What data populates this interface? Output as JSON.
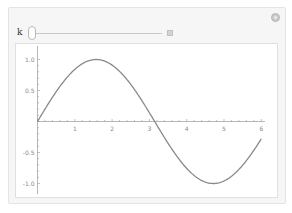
{
  "controls": {
    "parameter_label": "k",
    "slider_value": 0,
    "settings_icon": "gear-icon",
    "expand_icon": "plus-icon"
  },
  "plot": {
    "x_ticks": [
      "1",
      "2",
      "3",
      "4",
      "5",
      "6"
    ],
    "y_ticks": [
      "1.0",
      "0.5",
      "-0.5",
      "-1.0"
    ]
  },
  "chart_data": {
    "type": "line",
    "title": "",
    "xlabel": "",
    "ylabel": "",
    "xlim": [
      0,
      6.28
    ],
    "ylim": [
      -1.1,
      1.1
    ],
    "grid": false,
    "series": [
      {
        "name": "sin(x)",
        "x": [
          0,
          0.5,
          1,
          1.5,
          1.5708,
          2,
          2.5,
          3,
          3.1416,
          3.5,
          4,
          4.5,
          4.7124,
          5,
          5.5,
          6,
          6.2832
        ],
        "values": [
          0,
          0.479,
          0.841,
          0.997,
          1.0,
          0.909,
          0.598,
          0.141,
          0,
          -0.351,
          -0.757,
          -0.978,
          -1.0,
          -0.959,
          -0.706,
          -0.279,
          0
        ]
      }
    ],
    "color": "#8a8a8a"
  }
}
